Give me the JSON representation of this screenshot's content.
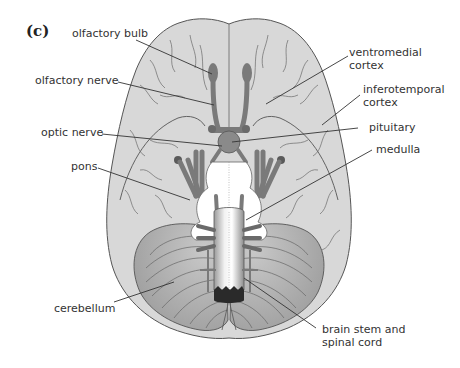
{
  "figure": {
    "panel_label": "(c)",
    "colors": {
      "cortex": "#d8d8d8",
      "cortex_outline": "#555555",
      "cerebellum": "#a9a9a9",
      "cerebellum_light": "#c4c4c4",
      "nerve": "#7a7a7a",
      "brainstem_white": "#ffffff",
      "leader_line": "#333333"
    },
    "labels_left": {
      "olfactory_bulb": "olfactory bulb",
      "olfactory_nerve": "olfactory nerve",
      "optic_nerve": "optic nerve",
      "pons": "pons",
      "cerebellum": "cerebellum"
    },
    "labels_right": {
      "ventromedial_line1": "ventromedial",
      "ventromedial_line2": "cortex",
      "inferotemporal_line1": "inferotemporal",
      "inferotemporal_line2": "cortex",
      "pituitary": "pituitary",
      "medulla": "medulla",
      "brainstem_line1": "brain stem and",
      "brainstem_line2": "spinal cord"
    }
  }
}
